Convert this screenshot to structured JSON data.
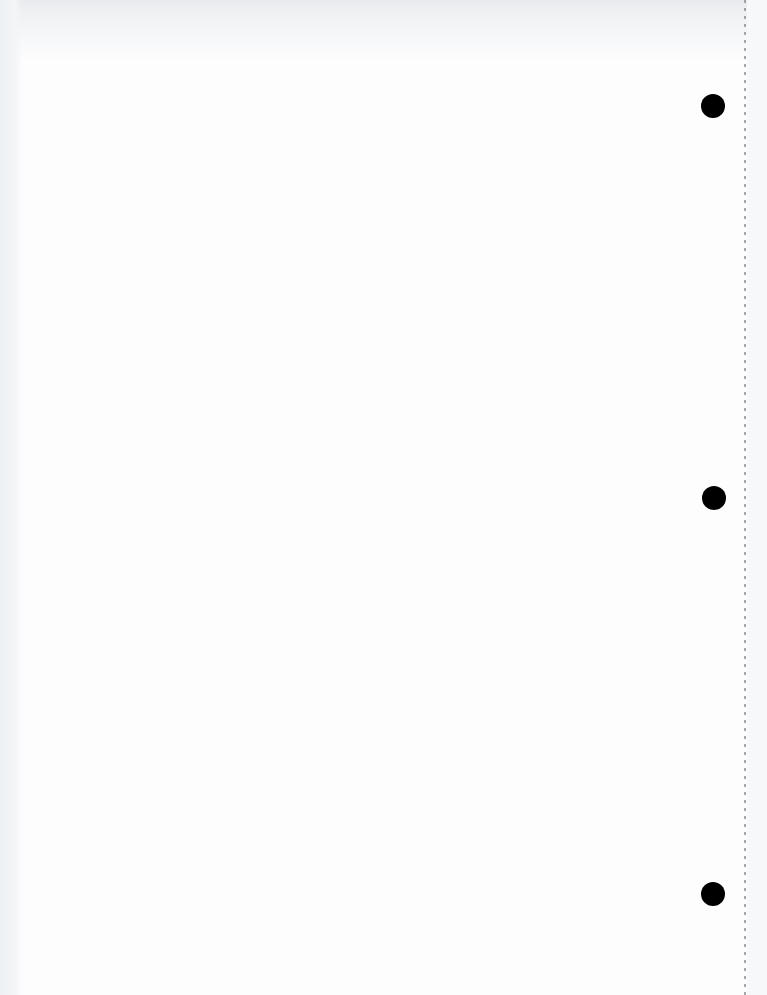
{
  "document": {
    "type": "blank loose-leaf page (scanned)",
    "text_content": "",
    "punch_holes": [
      {
        "cx": 713,
        "cy": 106,
        "diameter": 24
      },
      {
        "cx": 714,
        "cy": 498,
        "diameter": 24
      },
      {
        "cx": 713,
        "cy": 894,
        "diameter": 24
      }
    ],
    "perforation_line_x": 745,
    "colors": {
      "paper": "#fdfdfe",
      "hole": "#000000",
      "perforation": "#8a8a8a",
      "scan_shadow": "#e6e9ec"
    }
  }
}
